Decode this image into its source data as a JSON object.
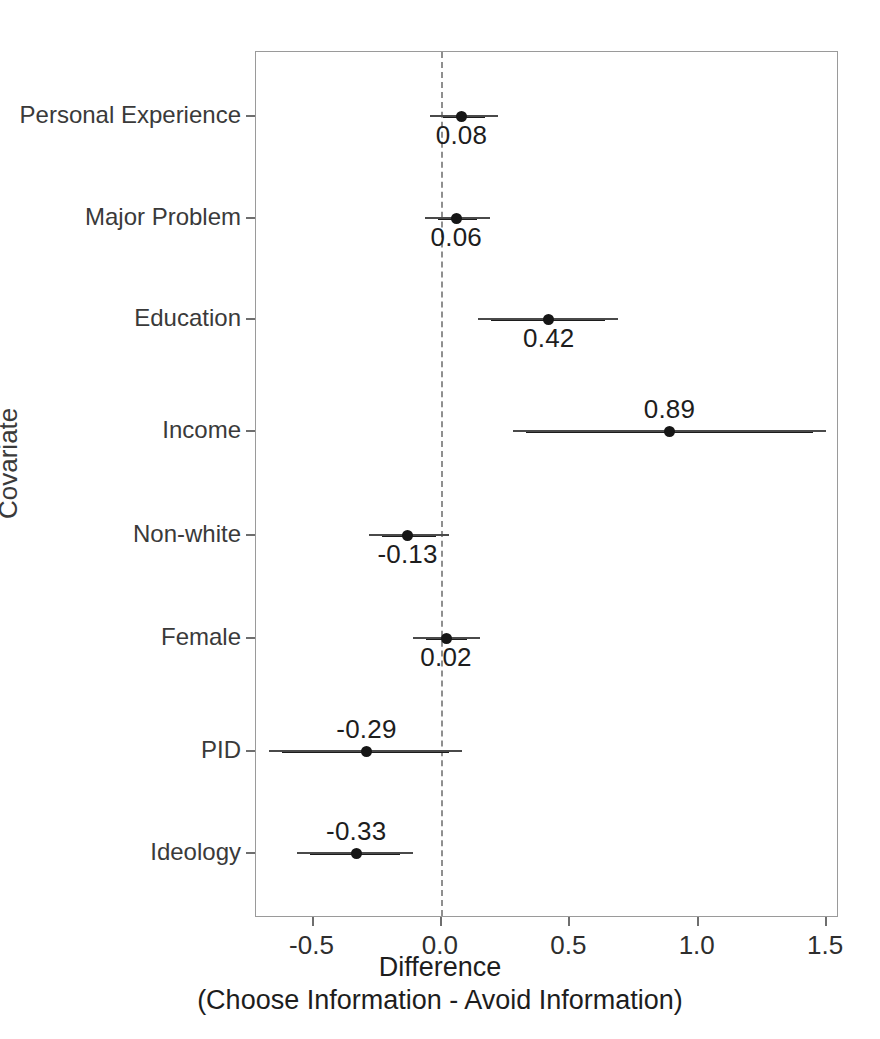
{
  "chart_data": {
    "type": "scatter",
    "plot_style": "coefficient-dot-plot-with-confidence-intervals",
    "title": "",
    "xlabel": "Difference",
    "xlabel_line2": "(Choose Information - Avoid Information)",
    "ylabel": "Covariate",
    "xlim": [
      -0.72,
      1.55
    ],
    "xticks": [
      -0.5,
      0.0,
      0.5,
      1.0,
      1.5
    ],
    "xticklabels": [
      "-0.5",
      "0.0",
      "0.5",
      "1.0",
      "1.5"
    ],
    "grid": false,
    "legend": null,
    "reference_line": {
      "x": 0.0,
      "style": "dashed",
      "color": "#8f8f8f"
    },
    "categories": [
      "Personal Experience",
      "Major Problem",
      "Education",
      "Income",
      "Non-white",
      "Female",
      "PID",
      "Ideology"
    ],
    "points": [
      {
        "label": "Personal Experience",
        "value": 0.08,
        "value_text": "0.08",
        "ci_low": 0.01,
        "ci_high": 0.17,
        "label_pos": "below"
      },
      {
        "label": "Major Problem",
        "value": 0.06,
        "value_text": "0.06",
        "ci_low": -0.01,
        "ci_high": 0.14,
        "label_pos": "below"
      },
      {
        "label": "Education",
        "value": 0.42,
        "value_text": "0.42",
        "ci_low": 0.195,
        "ci_high": 0.64,
        "label_pos": "below"
      },
      {
        "label": "Income",
        "value": 0.89,
        "value_text": "0.89",
        "ci_low": 0.33,
        "ci_high": 1.45,
        "label_pos": "above"
      },
      {
        "label": "Non-white",
        "value": -0.13,
        "value_text": "-0.13",
        "ci_low": -0.23,
        "ci_high": -0.02,
        "label_pos": "below"
      },
      {
        "label": "Female",
        "value": 0.02,
        "value_text": "0.02",
        "ci_low": -0.06,
        "ci_high": 0.1,
        "label_pos": "below"
      },
      {
        "label": "PID",
        "value": -0.29,
        "value_text": "-0.29",
        "ci_low": -0.62,
        "ci_high": 0.03,
        "label_pos": "above"
      },
      {
        "label": "Ideology",
        "value": -0.33,
        "value_text": "-0.33",
        "ci_low": -0.51,
        "ci_high": -0.16,
        "label_pos": "above"
      }
    ],
    "colors": {
      "point": "#161616",
      "interval": "#1c1c1c",
      "reference_line": "#8f8f8f",
      "frame": "#9a9a9a",
      "text": "#1d1d1d",
      "background": "#ffffff"
    }
  }
}
